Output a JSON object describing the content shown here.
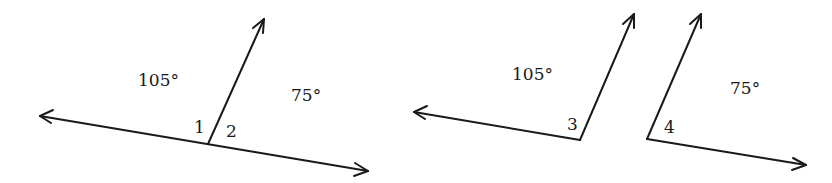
{
  "figures": [
    {
      "id": "linear-pair",
      "angles": [
        {
          "number": "1",
          "measure": "105°"
        },
        {
          "number": "2",
          "measure": "75°"
        }
      ]
    },
    {
      "id": "separated-angles",
      "angles": [
        {
          "number": "3",
          "measure": "105°"
        },
        {
          "number": "4",
          "measure": "75°"
        }
      ]
    }
  ],
  "colors": {
    "ink": "#1a1a1a",
    "background": "#ffffff"
  }
}
